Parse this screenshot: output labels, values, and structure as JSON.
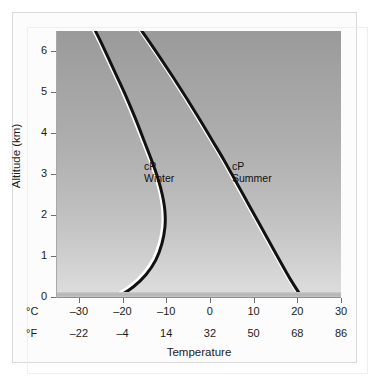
{
  "chart_data": {
    "type": "line",
    "title": "",
    "xlabel": "Temperature",
    "ylabel": "Altitude (km)",
    "xlim": [
      -35,
      30
    ],
    "ylim": [
      0,
      6.5
    ],
    "grid": false,
    "legend_position": "inline-annotations",
    "axes": {
      "x_primary": {
        "unit": "°C",
        "ticks": [
          -30,
          -20,
          -10,
          0,
          10,
          20,
          30
        ],
        "tick_labels": [
          "–30",
          "–20",
          "–10",
          "0",
          "10",
          "20",
          "30"
        ]
      },
      "x_secondary": {
        "unit": "°F",
        "ticks": [
          -22,
          -4,
          14,
          32,
          50,
          68,
          86
        ],
        "tick_labels": [
          "–22",
          "–4",
          "14",
          "32",
          "50",
          "68",
          "86"
        ]
      },
      "y": {
        "unit": "km",
        "ticks": [
          0,
          1,
          2,
          3,
          4,
          5,
          6
        ],
        "tick_labels": [
          "0",
          "1",
          "2",
          "3",
          "4",
          "5",
          "6"
        ]
      }
    },
    "series": [
      {
        "name": "cP Winter",
        "label_line1": "cP",
        "label_line2": "Winter",
        "color": "#111111",
        "highlight_color": "#ffffff",
        "points": [
          {
            "t": -21.0,
            "z": 0.0
          },
          {
            "t": -17.5,
            "z": 0.25
          },
          {
            "t": -14.6,
            "z": 0.55
          },
          {
            "t": -12.4,
            "z": 0.9
          },
          {
            "t": -11.0,
            "z": 1.3
          },
          {
            "t": -10.3,
            "z": 1.7
          },
          {
            "t": -10.3,
            "z": 2.1
          },
          {
            "t": -10.9,
            "z": 2.5
          },
          {
            "t": -11.9,
            "z": 2.9
          },
          {
            "t": -13.2,
            "z": 3.3
          },
          {
            "t": -15.0,
            "z": 3.8
          },
          {
            "t": -17.2,
            "z": 4.4
          },
          {
            "t": -19.6,
            "z": 5.0
          },
          {
            "t": -22.2,
            "z": 5.6
          },
          {
            "t": -24.8,
            "z": 6.2
          },
          {
            "t": -26.2,
            "z": 6.5
          }
        ]
      },
      {
        "name": "cP Summer",
        "label_line1": "cP",
        "label_line2": "Summer",
        "color": "#111111",
        "highlight_color": "#ffffff",
        "points": [
          {
            "t": 21.0,
            "z": 0.0
          },
          {
            "t": 18.6,
            "z": 0.4
          },
          {
            "t": 16.2,
            "z": 0.85
          },
          {
            "t": 13.6,
            "z": 1.35
          },
          {
            "t": 11.0,
            "z": 1.85
          },
          {
            "t": 8.4,
            "z": 2.35
          },
          {
            "t": 5.8,
            "z": 2.85
          },
          {
            "t": 3.2,
            "z": 3.35
          },
          {
            "t": 0.4,
            "z": 3.85
          },
          {
            "t": -2.4,
            "z": 4.35
          },
          {
            "t": -5.3,
            "z": 4.85
          },
          {
            "t": -8.3,
            "z": 5.35
          },
          {
            "t": -11.4,
            "z": 5.85
          },
          {
            "t": -14.6,
            "z": 6.35
          },
          {
            "t": -15.6,
            "z": 6.5
          }
        ]
      }
    ],
    "annotations": [
      {
        "text": "cP Winter",
        "near_series": "cP Winter"
      },
      {
        "text": "cP Summer",
        "near_series": "cP Summer"
      }
    ],
    "surface_band": {
      "label": "ground",
      "color": "#b4b4b4"
    },
    "background": {
      "type": "vertical-gradient",
      "top_color": "#9a9a9a",
      "bottom_color": "#dedede"
    }
  },
  "figure": {
    "frame_color": "#d9d9d9",
    "page_background": "#ffffff"
  }
}
